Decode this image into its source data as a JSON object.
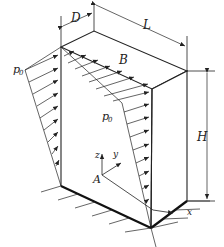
{
  "figure": {
    "labels": {
      "D": "D",
      "L": "L",
      "B": "B",
      "H": "H",
      "A": "A",
      "p0_left": "p",
      "p0_left_sub": "0",
      "p0_front": "p",
      "p0_front_sub": "0",
      "axis_x": "x",
      "axis_y": "y",
      "axis_z": "z"
    },
    "colors": {
      "stroke": "#222222",
      "background": "#ffffff"
    }
  }
}
